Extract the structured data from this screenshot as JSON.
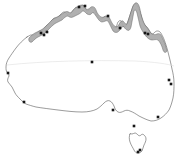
{
  "figure": {
    "alt_text": "Outline map of Australia with shaded northern tropical coastal range band and black occurrence point records",
    "width": 181,
    "height": 159,
    "background_color": "#ffffff"
  },
  "legend": {
    "range_band_label": "Shaded range band (northern tropical coast)",
    "record_dot_label": "Occurrence record",
    "outline_label": "Coastline outline",
    "graticule_label": "Tropic of Capricorn reference line"
  },
  "colors": {
    "land_fill": "#ffffff",
    "coastline_stroke": "#4a4a4a",
    "range_fill": "#a9a9a9",
    "range_stroke": "#5a5a5a",
    "dot_fill": "#161616",
    "graticule_stroke": "#d8d8d8"
  },
  "chart_data": {
    "type": "scatter",
    "xlabel": "",
    "ylabel": "",
    "xlim": [
      0,
      181
    ],
    "ylim": [
      0,
      159
    ],
    "grid": false,
    "legend_position": "none",
    "projection_note": "pixel coordinates of the 181x159 raster, origin top-left",
    "series": [
      {
        "name": "Occurrence records",
        "marker": "square",
        "color": "#161616",
        "points": [
          {
            "x": 44,
            "y": 35,
            "region": "Kimberley coast"
          },
          {
            "x": 41,
            "y": 33,
            "region": "Kimberley coast"
          },
          {
            "x": 47,
            "y": 32,
            "region": "Kimberley coast"
          },
          {
            "x": 79,
            "y": 7,
            "region": "Darwin / Top End"
          },
          {
            "x": 85,
            "y": 6,
            "region": "Top End"
          },
          {
            "x": 108,
            "y": 16,
            "region": "Gulf of Carpentaria"
          },
          {
            "x": 120,
            "y": 28,
            "region": "Gulf of Carpentaria south"
          },
          {
            "x": 145,
            "y": 33,
            "region": "North Queensland coast"
          },
          {
            "x": 148,
            "y": 34,
            "region": "North Queensland coast"
          },
          {
            "x": 92,
            "y": 62,
            "region": "Central Australia"
          },
          {
            "x": 171,
            "y": 84,
            "region": "Southeast Queensland coast"
          },
          {
            "x": 169,
            "y": 80,
            "region": "Southeast Queensland coast"
          },
          {
            "x": 8,
            "y": 73,
            "region": "Western Australia mid-coast"
          },
          {
            "x": 24,
            "y": 102,
            "region": "Southwest Western Australia"
          },
          {
            "x": 113,
            "y": 110,
            "region": "South Australia gulfs"
          },
          {
            "x": 158,
            "y": 117,
            "region": "New South Wales coast"
          },
          {
            "x": 134,
            "y": 126,
            "region": "Victoria coast"
          },
          {
            "x": 138,
            "y": 152,
            "region": "Tasmania"
          },
          {
            "x": 140,
            "y": 150,
            "region": "Tasmania"
          }
        ]
      }
    ],
    "shaded_regions": [
      {
        "name": "Northern tropical coastal range band",
        "fill": "#a9a9a9",
        "description": "Continuous grey band hugging the coastline from the Kimberley in the northwest, across the Top End and Gulf of Carpentaria, to Cape York and the north Queensland coast"
      }
    ],
    "reference_lines": [
      {
        "name": "Tropic of Capricorn",
        "orientation": "horizontal",
        "y": 62,
        "color": "#d8d8d8"
      }
    ]
  }
}
